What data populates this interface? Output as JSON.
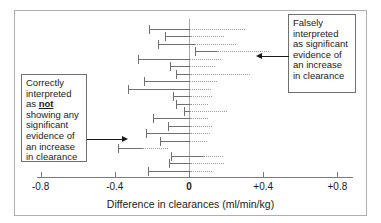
{
  "chart_data": {
    "type": "forest",
    "title": "",
    "xlabel": "Difference in clearances (ml/min/kg)",
    "ylabel": "",
    "xlim": [
      -0.85,
      0.85
    ],
    "xticks": [
      -0.8,
      -0.4,
      0,
      0.4,
      0.8
    ],
    "xticklabels": [
      "-0.8",
      "-0.4",
      "0",
      "+0.4",
      "+0.8"
    ],
    "grid": false,
    "legend": "none",
    "reference_line": 0,
    "note": "Each row is a study confidence interval. The solid segment spans the observed interval; the dotted segment is the extension of the interval beyond the plotted solid portion.",
    "intervals": [
      {
        "index": 1,
        "solid_low": -0.215,
        "solid_high": 0.005,
        "dotted_high": 0.3,
        "crosses_zero": true
      },
      {
        "index": 2,
        "solid_low": -0.13,
        "solid_high": 0.005,
        "dotted_high": 0.19,
        "crosses_zero": true
      },
      {
        "index": 3,
        "solid_low": -0.165,
        "solid_high": 0.03,
        "dotted_high": 0.255,
        "crosses_zero": true
      },
      {
        "index": 4,
        "solid_low": 0.03,
        "solid_high": 0.15,
        "dotted_high": 0.43,
        "crosses_zero": false
      },
      {
        "index": 5,
        "solid_low": -0.275,
        "solid_high": 0.005,
        "dotted_high": 0.175,
        "crosses_zero": true
      },
      {
        "index": 6,
        "solid_low": -0.105,
        "solid_high": 0.005,
        "dotted_high": 0.14,
        "crosses_zero": true
      },
      {
        "index": 7,
        "solid_low": -0.07,
        "solid_high": 0.005,
        "dotted_high": 0.33,
        "crosses_zero": true
      },
      {
        "index": 8,
        "solid_low": -0.24,
        "solid_high": 0.005,
        "dotted_high": 0.15,
        "crosses_zero": true
      },
      {
        "index": 9,
        "solid_low": -0.33,
        "solid_high": 0.005,
        "dotted_high": 0.12,
        "crosses_zero": true
      },
      {
        "index": 10,
        "solid_low": -0.085,
        "solid_high": 0.005,
        "dotted_high": 0.125,
        "crosses_zero": true
      },
      {
        "index": 11,
        "solid_low": -0.07,
        "solid_high": 0.005,
        "dotted_high": 0.105,
        "crosses_zero": true
      },
      {
        "index": 12,
        "solid_low": -0.025,
        "solid_high": 0.005,
        "dotted_high": 0.205,
        "crosses_zero": true
      },
      {
        "index": 13,
        "solid_low": -0.195,
        "solid_high": 0.005,
        "dotted_high": 0.1,
        "crosses_zero": true
      },
      {
        "index": 14,
        "solid_low": -0.115,
        "solid_high": 0.005,
        "dotted_high": 0.125,
        "crosses_zero": true
      },
      {
        "index": 15,
        "solid_low": -0.23,
        "solid_high": 0.005,
        "dotted_high": 0.115,
        "crosses_zero": true
      },
      {
        "index": 16,
        "solid_low": -0.155,
        "solid_high": 0.005,
        "dotted_high": 0.095,
        "crosses_zero": true
      },
      {
        "index": 17,
        "solid_low": -0.385,
        "solid_high": -0.255,
        "dotted_high": -0.115,
        "crosses_zero": false
      },
      {
        "index": 18,
        "solid_low": -0.095,
        "solid_high": 0.075,
        "dotted_high": 0.185,
        "crosses_zero": true
      },
      {
        "index": 19,
        "solid_low": -0.11,
        "solid_high": 0.005,
        "dotted_high": 0.19,
        "crosses_zero": true
      },
      {
        "index": 20,
        "solid_low": -0.22,
        "solid_high": 0.005,
        "dotted_high": 0.125,
        "crosses_zero": true
      }
    ]
  },
  "axis": {
    "title": "Difference in clearances (ml/min/kg)",
    "ticks": [
      {
        "value": -0.8,
        "label": "-0.8",
        "bold": false
      },
      {
        "value": -0.4,
        "label": "-0.4",
        "bold": false
      },
      {
        "value": 0,
        "label": "0",
        "bold": true
      },
      {
        "value": 0.4,
        "label": "+0.4",
        "bold": false
      },
      {
        "value": 0.8,
        "label": "+0.8",
        "bold": false
      }
    ]
  },
  "annotations": {
    "left": {
      "lines_before": "Correctly interpreted as ",
      "emphasis": "not",
      "lines_after": " showing any significant evidence of an increase in clearance",
      "full_text": "Correctly interpreted as not showing any significant evidence of an increase in clearance",
      "points_to_interval": 17
    },
    "right": {
      "full_text": "Falsely interpreted as significant evidence of an increase in clearance",
      "points_to_interval": 4
    }
  }
}
